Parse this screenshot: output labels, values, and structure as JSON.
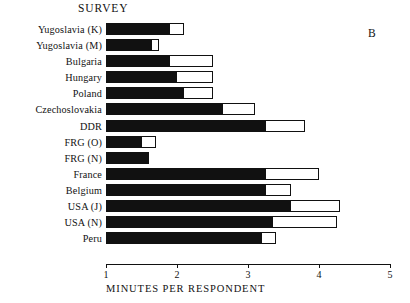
{
  "figure": {
    "title": "SURVEY",
    "panel_letter": "B"
  },
  "chart_data": {
    "type": "bar",
    "orientation": "horizontal",
    "title": "SURVEY",
    "panel_label": "B",
    "xlabel": "MINUTES PER RESPONDENT",
    "ylabel": "",
    "xlim": [
      1,
      5
    ],
    "xticks": [
      1,
      2,
      3,
      4,
      5
    ],
    "xticklabels": [
      "1",
      "2",
      "3",
      "4",
      "5"
    ],
    "grid": false,
    "legend": "none",
    "series": [
      {
        "name": "inner (black)",
        "color": "#111111"
      },
      {
        "name": "outer (white)",
        "color": "#ffffff"
      }
    ],
    "categories": [
      "Yugoslavia (K)",
      "Yugoslavia (M)",
      "Bulgaria",
      "Hungary",
      "Poland",
      "Czechoslovakia",
      "DDR",
      "FRG (O)",
      "FRG (N)",
      "France",
      "Belgium",
      "USA (J)",
      "USA (N)",
      "Peru"
    ],
    "black_values": [
      1.9,
      1.65,
      1.9,
      2.0,
      2.1,
      2.65,
      3.25,
      1.5,
      1.6,
      3.25,
      3.25,
      3.6,
      3.35,
      3.2
    ],
    "white_values": [
      2.1,
      1.75,
      2.5,
      2.5,
      2.5,
      3.1,
      3.8,
      1.7,
      1.6,
      4.0,
      3.6,
      4.3,
      4.25,
      3.4
    ],
    "rows": [
      {
        "label": "Yugoslavia (K)",
        "black": 1.9,
        "white": 2.1
      },
      {
        "label": "Yugoslavia (M)",
        "black": 1.65,
        "white": 1.75
      },
      {
        "label": "Bulgaria",
        "black": 1.9,
        "white": 2.5
      },
      {
        "label": "Hungary",
        "black": 2.0,
        "white": 2.5
      },
      {
        "label": "Poland",
        "black": 2.1,
        "white": 2.5
      },
      {
        "label": "Czechoslovakia",
        "black": 2.65,
        "white": 3.1
      },
      {
        "label": "DDR",
        "black": 3.25,
        "white": 3.8
      },
      {
        "label": "FRG (O)",
        "black": 1.5,
        "white": 1.7
      },
      {
        "label": "FRG (N)",
        "black": 1.6,
        "white": 1.6
      },
      {
        "label": "France",
        "black": 3.25,
        "white": 4.0
      },
      {
        "label": "Belgium",
        "black": 3.25,
        "white": 3.6
      },
      {
        "label": "USA (J)",
        "black": 3.6,
        "white": 4.3
      },
      {
        "label": "USA (N)",
        "black": 3.35,
        "white": 4.25
      },
      {
        "label": "Peru",
        "black": 3.2,
        "white": 3.4
      }
    ]
  },
  "axis": {
    "xlabel": "MINUTES PER RESPONDENT",
    "ticks": [
      "1",
      "2",
      "3",
      "4",
      "5"
    ]
  },
  "colors": {
    "bar_fill": "#111111",
    "bar_outline": "#111111",
    "background": "#ffffff"
  }
}
